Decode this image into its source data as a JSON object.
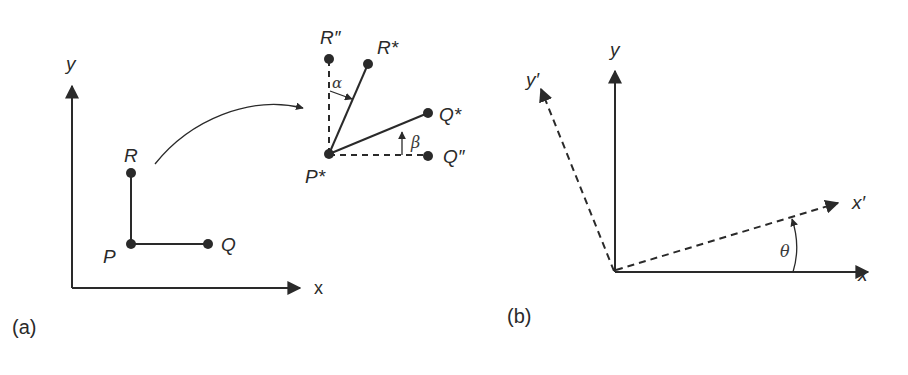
{
  "panel_a": {
    "caption": "(a)",
    "axes": {
      "x_label": "x",
      "y_label": "y"
    },
    "points": {
      "P": "P",
      "Q": "Q",
      "R": "R"
    },
    "transformed": {
      "P_star": "P*",
      "Q_star": "Q*",
      "R_star": "R*",
      "Q_dprime": "Q″",
      "R_dprime": "R″",
      "alpha": "α",
      "beta": "β"
    }
  },
  "panel_b": {
    "caption": "(b)",
    "axes": {
      "x_label": "x",
      "y_label": "y",
      "x_prime_label": "x′",
      "y_prime_label": "y′",
      "theta": "θ"
    }
  },
  "colors": {
    "ink": "#2a2a2a",
    "background": "#ffffff"
  }
}
